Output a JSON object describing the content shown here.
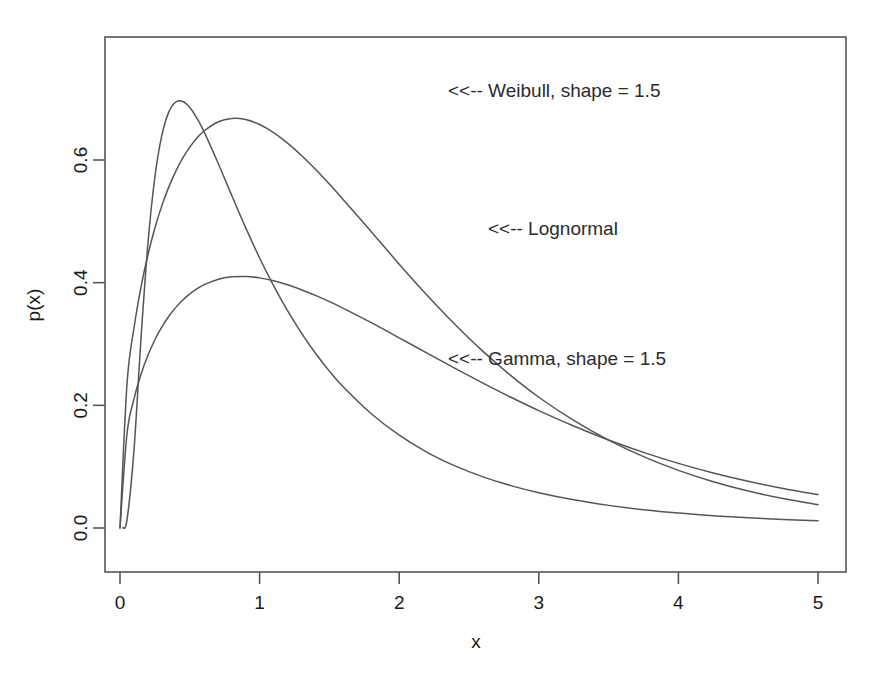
{
  "chart_data": {
    "type": "line",
    "title": "",
    "subtitle": "",
    "xlabel": "x",
    "ylabel": "p(x)",
    "xlim": [
      0,
      5
    ],
    "ylim": [
      0,
      0.78
    ],
    "grid": false,
    "legend_position": "inline-annotations",
    "x_ticks": [
      "0",
      "1",
      "2",
      "3",
      "4",
      "5"
    ],
    "x_tick_values": [
      0,
      1,
      2,
      3,
      4,
      5
    ],
    "y_ticks": [
      "0.0",
      "0.2",
      "0.4",
      "0.6"
    ],
    "y_tick_values": [
      0.0,
      0.2,
      0.4,
      0.6
    ],
    "series": [
      {
        "name": "Weibull, shape = 1.5",
        "distribution": "weibull",
        "shape": 1.5,
        "scale": 1.1078,
        "color": "#555555",
        "peak_x": 0.52,
        "peak_y": 0.761,
        "x": [
          0.0,
          0.05,
          0.1,
          0.15,
          0.2,
          0.25,
          0.3,
          0.35,
          0.4,
          0.45,
          0.5,
          0.55,
          0.6,
          0.7,
          0.8,
          0.9,
          1.0,
          1.1,
          1.2,
          1.3,
          1.4,
          1.5,
          1.6,
          1.8,
          2.0,
          2.2,
          2.4,
          2.6,
          2.8,
          3.0,
          3.25,
          3.5,
          3.75,
          4.0,
          4.25,
          4.5,
          4.75,
          5.0
        ],
        "values": [
          0.0,
          0.2345,
          0.3257,
          0.3925,
          0.4455,
          0.4891,
          0.5256,
          0.5562,
          0.5819,
          0.6034,
          0.6211,
          0.6355,
          0.6469,
          0.6619,
          0.6677,
          0.6659,
          0.6578,
          0.6447,
          0.6276,
          0.6074,
          0.5849,
          0.5607,
          0.5353,
          0.4829,
          0.4302,
          0.3794,
          0.3317,
          0.2879,
          0.2484,
          0.2132,
          0.1753,
          0.1432,
          0.1163,
          0.0939,
          0.0754,
          0.0603,
          0.048,
          0.038
        ]
      },
      {
        "name": "Lognormal",
        "distribution": "lognormal",
        "meanlog": -0.2,
        "sdlog": 0.62,
        "color": "#555555",
        "peak_x": 0.39,
        "peak_y": 0.663,
        "x": [
          0.02,
          0.05,
          0.1,
          0.15,
          0.2,
          0.25,
          0.3,
          0.35,
          0.4,
          0.45,
          0.5,
          0.55,
          0.6,
          0.7,
          0.8,
          0.9,
          1.0,
          1.1,
          1.2,
          1.3,
          1.4,
          1.5,
          1.6,
          1.8,
          2.0,
          2.2,
          2.4,
          2.6,
          2.8,
          3.0,
          3.25,
          3.5,
          3.75,
          4.0,
          4.25,
          4.5,
          4.75,
          5.0
        ],
        "values": [
          0.0001,
          0.0131,
          0.1265,
          0.3075,
          0.4637,
          0.5724,
          0.6405,
          0.6784,
          0.6946,
          0.6954,
          0.6857,
          0.6687,
          0.6471,
          0.5963,
          0.5424,
          0.4897,
          0.4403,
          0.3951,
          0.3543,
          0.3177,
          0.285,
          0.2558,
          0.2298,
          0.1862,
          0.1513,
          0.1234,
          0.1012,
          0.0834,
          0.0691,
          0.0575,
          0.0459,
          0.0369,
          0.0299,
          0.0244,
          0.0201,
          0.0166,
          0.0139,
          0.0117
        ]
      },
      {
        "name": "Gamma, shape = 1.5",
        "distribution": "gamma",
        "shape": 1.5,
        "rate": 1.05,
        "color": "#555555",
        "peak_x": 0.48,
        "peak_y": 0.47,
        "x": [
          0.0,
          0.05,
          0.1,
          0.15,
          0.2,
          0.25,
          0.3,
          0.35,
          0.4,
          0.45,
          0.5,
          0.55,
          0.6,
          0.7,
          0.8,
          0.9,
          1.0,
          1.1,
          1.2,
          1.3,
          1.4,
          1.5,
          1.6,
          1.8,
          2.0,
          2.2,
          2.4,
          2.6,
          2.8,
          3.0,
          3.25,
          3.5,
          3.75,
          4.0,
          4.25,
          4.5,
          4.75,
          5.0
        ],
        "values": [
          0.0,
          0.1532,
          0.2101,
          0.2503,
          0.2816,
          0.3069,
          0.3278,
          0.3452,
          0.3597,
          0.3717,
          0.3817,
          0.3898,
          0.3963,
          0.4052,
          0.4095,
          0.4101,
          0.4078,
          0.4031,
          0.3965,
          0.3885,
          0.3792,
          0.3691,
          0.3582,
          0.3348,
          0.3101,
          0.2851,
          0.2604,
          0.2363,
          0.2132,
          0.1914,
          0.1663,
          0.1435,
          0.1233,
          0.1054,
          0.0898,
          0.0762,
          0.0645,
          0.0545
        ]
      }
    ],
    "annotations": [
      {
        "text": "<<-- Weibull, shape = 1.5",
        "x_px": 448,
        "y_px": 97,
        "target_series": "Weibull, shape = 1.5"
      },
      {
        "text": "<<-- Lognormal",
        "x_px": 488,
        "y_px": 235,
        "target_series": "Lognormal"
      },
      {
        "text": "<<-- Gamma, shape = 1.5",
        "x_px": 448,
        "y_px": 365,
        "target_series": "Gamma, shape = 1.5"
      }
    ],
    "colors": {
      "curve": "#555555",
      "axis": "#555555",
      "text": "#1a1a1a",
      "background": "#ffffff"
    },
    "plot_box_px": {
      "left": 105,
      "top": 37,
      "right": 846,
      "bottom": 572
    }
  }
}
